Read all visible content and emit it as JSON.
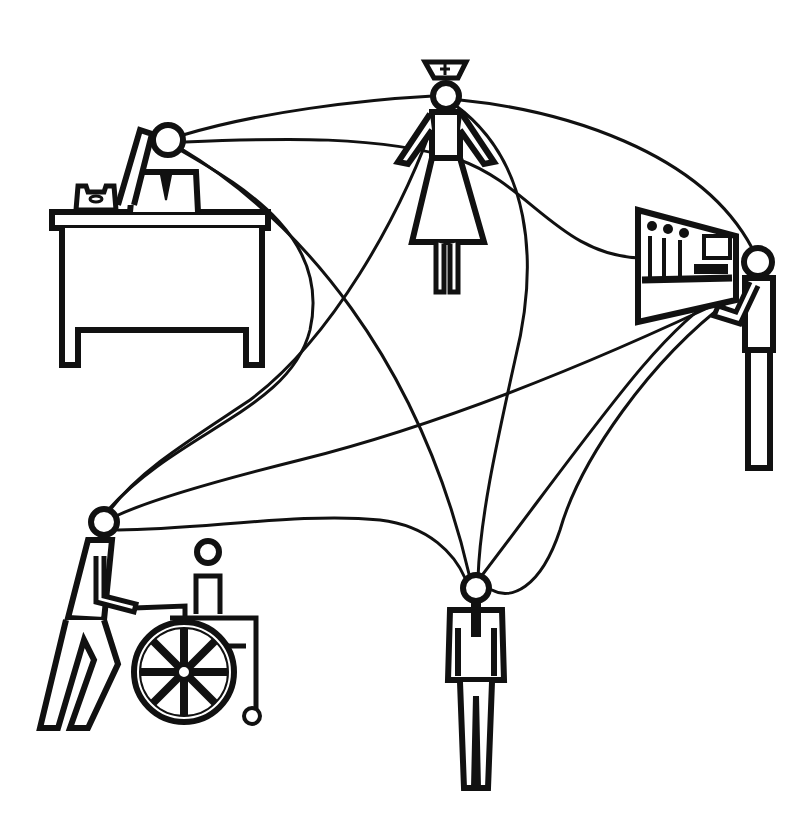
{
  "figure": {
    "type": "network-illustration",
    "background": "#ffffff",
    "ink": "#111111",
    "nodes": [
      {
        "id": "office-worker",
        "label": "Office worker at desk with telephone",
        "head": [
          168,
          140
        ]
      },
      {
        "id": "nurse",
        "label": "Nurse",
        "head": [
          446,
          96
        ]
      },
      {
        "id": "technician",
        "label": "Technician at control panel",
        "head": [
          758,
          262
        ]
      },
      {
        "id": "caregiver",
        "label": "Caregiver pushing wheelchair",
        "head": [
          104,
          522
        ]
      },
      {
        "id": "man",
        "label": "Standing man",
        "head": [
          476,
          588
        ]
      }
    ],
    "connections": [
      [
        "office-worker",
        "nurse"
      ],
      [
        "office-worker",
        "technician"
      ],
      [
        "office-worker",
        "caregiver"
      ],
      [
        "office-worker",
        "man"
      ],
      [
        "nurse",
        "technician"
      ],
      [
        "nurse",
        "caregiver"
      ],
      [
        "nurse",
        "man"
      ],
      [
        "technician",
        "caregiver"
      ],
      [
        "technician",
        "man"
      ],
      [
        "caregiver",
        "man"
      ]
    ]
  }
}
